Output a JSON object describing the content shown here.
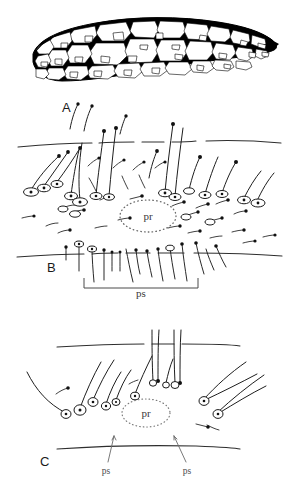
{
  "figure": {
    "caption_absent": true,
    "background_color": "#ffffff",
    "ink_color": "#000000",
    "line_color_soft": "#3f3f3f",
    "panels": [
      {
        "id": "A",
        "label": "A",
        "label_x": 62,
        "label_y": 112,
        "type": "cellular-plate",
        "description": "curved elongate plate filled with irregular polygonal cells"
      },
      {
        "id": "B",
        "label": "B",
        "label_x": 47,
        "label_y": 272,
        "type": "segment-with-setae",
        "annotations": [
          {
            "name": "pr",
            "text": "pr",
            "x": 148,
            "y": 216,
            "style": "dotted-oval"
          },
          {
            "name": "ps",
            "text": "ps",
            "x": 141,
            "y": 294,
            "style": "bracket"
          }
        ]
      },
      {
        "id": "C",
        "label": "C",
        "label_x": 40,
        "label_y": 466,
        "type": "segment-with-setae",
        "annotations": [
          {
            "name": "pr",
            "text": "pr",
            "x": 146,
            "y": 413,
            "style": "dotted-oval"
          },
          {
            "name": "ps-left",
            "text": "ps",
            "x": 106,
            "y": 473,
            "style": "leader-line"
          },
          {
            "name": "ps-right",
            "text": "ps",
            "x": 187,
            "y": 473,
            "style": "leader-line"
          }
        ]
      }
    ]
  },
  "labels": {
    "panel_a": "A",
    "panel_b": "B",
    "panel_c": "C",
    "pr": "pr",
    "ps": "ps"
  }
}
